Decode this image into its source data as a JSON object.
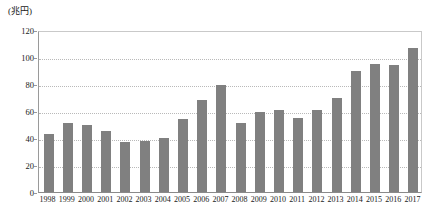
{
  "chart_data": {
    "type": "bar",
    "title": "",
    "subtitle": "",
    "unit_label": "(兆円)",
    "xlabel": "",
    "ylabel": "",
    "ylim": [
      0,
      120
    ],
    "ytick_step": 20,
    "yticks": [
      "0",
      "20",
      "40",
      "60",
      "80",
      "100",
      "120"
    ],
    "grid": true,
    "legend": false,
    "legend_position": "none",
    "bar_color": "#808080",
    "categories": [
      "1998",
      "1999",
      "2000",
      "2001",
      "2002",
      "2003",
      "2004",
      "2005",
      "2006",
      "2007",
      "2008",
      "2009",
      "2010",
      "2011",
      "2012",
      "2013",
      "2014",
      "2015",
      "2016",
      "2017"
    ],
    "values": [
      43,
      51,
      50,
      45,
      37,
      38,
      40,
      54,
      68,
      79,
      51,
      59,
      61,
      55,
      61,
      70,
      90,
      95,
      94,
      107
    ]
  }
}
